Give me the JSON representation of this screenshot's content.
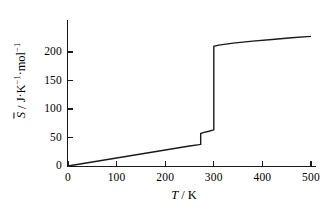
{
  "chart_data": {
    "type": "line",
    "title": "",
    "xlabel": "T / K",
    "ylabel": "S̅ / J·K⁻¹·mol⁻¹",
    "xlabel_parts": {
      "symbol": "T",
      "sep": " / ",
      "unit": "K"
    },
    "ylabel_parts": {
      "symbol": "S",
      "overbar": true,
      "sep": " / ",
      "unit": "J·K⁻¹·mol⁻¹"
    },
    "xlim": [
      0,
      510
    ],
    "ylim": [
      0,
      232
    ],
    "xticks": [
      0,
      100,
      200,
      300,
      400,
      500
    ],
    "yticks": [
      0,
      50,
      100,
      150,
      200
    ],
    "xticklabels": [
      "0",
      "100",
      "200",
      "300",
      "400",
      "500"
    ],
    "yticklabels": [
      "0",
      "50",
      "100",
      "150",
      "200"
    ],
    "grid": false,
    "legend": false,
    "line_color": "#1a1a1a",
    "series": [
      {
        "name": "molar entropy",
        "x": [
          0,
          50,
          100,
          150,
          200,
          250,
          270,
          272,
          273,
          273,
          280,
          290,
          298,
          300,
          300,
          310,
          340,
          380,
          420,
          460,
          500
        ],
        "y": [
          0,
          7,
          14,
          21,
          28,
          35,
          37.5,
          38,
          38,
          57,
          59,
          61,
          63,
          63.5,
          210,
          212,
          215.5,
          219,
          222,
          225,
          227.5
        ]
      }
    ],
    "annotations": [
      {
        "label": "fusion-transition",
        "x": 273,
        "y_from": 38,
        "y_to": 57
      },
      {
        "label": "vaporization-transition",
        "x": 300,
        "y_from": 63.5,
        "y_to": 210
      }
    ]
  }
}
